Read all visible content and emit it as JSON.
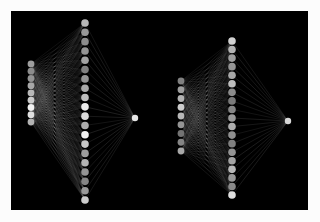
{
  "figure": {
    "title": "Neural network architecture diagram",
    "background_color": "#fcfcfc",
    "canvas_color": "#000000",
    "canvas": {
      "x": 11,
      "y": 11,
      "width": 297,
      "height": 199
    },
    "node_color_bright": "#f2f2f2",
    "node_color_mid": "#9a9a9a",
    "node_color_dim": "#4a4a4a",
    "edge_color": "#b8b8b8",
    "network_count": 2
  },
  "networks": [
    {
      "id": "network-left",
      "label": "Left network",
      "layers": [
        {
          "id": "input",
          "label": "Input layer",
          "node_count": 9,
          "x": 20,
          "y_start": 53,
          "y_end": 111,
          "radius": 3.4,
          "brightness": [
            0.62,
            0.55,
            0.58,
            0.66,
            0.72,
            0.8,
            0.95,
            0.88,
            0.7
          ]
        },
        {
          "id": "hidden",
          "label": "Hidden layer",
          "node_count": 20,
          "x": 74,
          "y_start": 12,
          "y_end": 189,
          "radius": 3.8,
          "brightness": [
            0.72,
            0.6,
            0.55,
            0.58,
            0.64,
            0.5,
            0.58,
            0.66,
            0.74,
            0.92,
            0.86,
            0.68,
            0.95,
            0.78,
            0.62,
            0.7,
            0.58,
            0.52,
            0.6,
            0.8
          ]
        },
        {
          "id": "output",
          "label": "Output node",
          "node_count": 1,
          "x": 124,
          "y_start": 107,
          "y_end": 107,
          "radius": 3.2,
          "brightness": [
            0.9
          ]
        }
      ]
    },
    {
      "id": "network-right",
      "label": "Right network",
      "layers": [
        {
          "id": "input",
          "label": "Input layer",
          "node_count": 9,
          "x": 170,
          "y_start": 70,
          "y_end": 140,
          "radius": 3.4,
          "brightness": [
            0.5,
            0.62,
            0.7,
            0.8,
            0.72,
            0.58,
            0.45,
            0.52,
            0.66
          ]
        },
        {
          "id": "hidden",
          "label": "Hidden layer",
          "node_count": 19,
          "x": 221,
          "y_start": 30,
          "y_end": 184,
          "radius": 3.8,
          "brightness": [
            0.82,
            0.7,
            0.62,
            0.58,
            0.66,
            0.74,
            0.55,
            0.48,
            0.52,
            0.6,
            0.68,
            0.56,
            0.5,
            0.58,
            0.64,
            0.72,
            0.6,
            0.54,
            0.88
          ]
        },
        {
          "id": "output",
          "label": "Output node",
          "node_count": 1,
          "x": 277,
          "y_start": 110,
          "y_end": 110,
          "radius": 3.2,
          "brightness": [
            0.85
          ]
        }
      ]
    }
  ]
}
